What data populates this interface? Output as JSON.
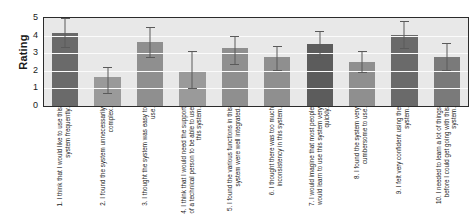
{
  "chart_data": {
    "type": "bar",
    "title": "",
    "xlabel": "",
    "ylabel": "Rating",
    "ylim": [
      0,
      5
    ],
    "yticks": [
      0,
      1,
      2,
      3,
      4,
      5
    ],
    "grid": true,
    "legend": "none",
    "categories": [
      "1. I think that I would like to use this system frequently.",
      "2. I found the system unnecessarily complex.",
      "3. I thought the system was easy to use.",
      "4. I think that I would need the support of a technical person to be able to use this system.",
      "5. I found the various functions in this system were well integrated.",
      "6. I thought there was too much inconsistency in this system.",
      "7. I would imagine that most people would learn to use this system very quickly.",
      "8. I found the system very cumbersome to use.",
      "9. I felt very confident using the system.",
      "10. I needed to learn a lot of things before I could get going with this system."
    ],
    "values": [
      4.15,
      1.65,
      3.65,
      2.0,
      3.3,
      2.8,
      3.5,
      2.5,
      4.05,
      2.8
    ],
    "errors_upper": [
      0.85,
      0.55,
      0.85,
      1.1,
      0.7,
      0.6,
      0.75,
      0.65,
      0.8,
      0.8
    ],
    "errors_lower": [
      0.85,
      0.95,
      0.95,
      1.05,
      0.95,
      0.8,
      0.75,
      0.65,
      0.8,
      0.8
    ],
    "bar_colors": [
      "#6a6a6a",
      "#9a9a9a",
      "#8f8f8f",
      "#9a9a9a",
      "#8f8f8f",
      "#8f8f8f",
      "#5c5c5c",
      "#8f8f8f",
      "#6a6a6a",
      "#7a7a7a"
    ],
    "colors": {
      "plot_background": "#e8e8e8",
      "gridline": "#fbfbfb",
      "axis": "#2b2b2b",
      "error_bar": "#5a5a5a",
      "text": "#1a1a1a"
    }
  },
  "axis": {
    "y_title": "Rating",
    "y_tick_labels": [
      "5",
      "4",
      "3",
      "2",
      "1",
      "0"
    ]
  }
}
